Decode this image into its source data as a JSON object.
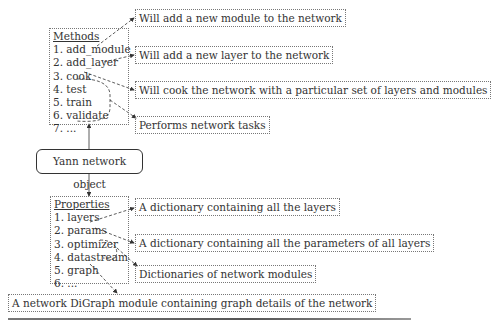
{
  "central_node": {
    "label": "Yann network object"
  },
  "methods": {
    "heading": "Methods",
    "items": [
      "1. add_module",
      "2. add_layer",
      "3. cook",
      "4. test",
      "5. train",
      "6. validate",
      "7. ..."
    ],
    "callouts": [
      "Will add a new module to the network",
      "Will add a new layer to the network",
      "Will cook the network with a particular set of layers and modules",
      "Performs network tasks"
    ]
  },
  "properties": {
    "heading": "Properties",
    "items": [
      "1. layers",
      "2. params",
      "3. optimizer",
      "4. datastream",
      "5. graph",
      "6. ..."
    ],
    "callouts": [
      "A dictionary containing all the layers",
      "A dictionary containing all the parameters of all layers",
      "Dictionaries of network modules",
      "A network DiGraph module containing graph details of the network"
    ]
  }
}
